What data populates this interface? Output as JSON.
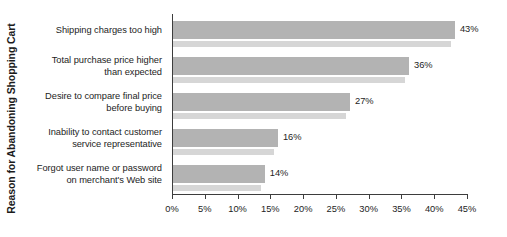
{
  "chart_data": {
    "type": "bar",
    "orientation": "horizontal",
    "title": "",
    "xlabel": "",
    "ylabel": "Reason for Abandoning Shopping Cart",
    "categories": [
      "Shipping charges too high",
      "Total purchase price higher\nthan expected",
      "Desire to compare final price\nbefore buying",
      "Inability to contact customer\nservice representative",
      "Forgot user name or password\non merchant's Web site"
    ],
    "values": [
      43,
      36,
      27,
      16,
      14
    ],
    "value_labels": [
      "43%",
      "36%",
      "27%",
      "16%",
      "14%"
    ],
    "xlim": [
      0,
      45
    ],
    "xticks": [
      0,
      5,
      10,
      15,
      20,
      25,
      30,
      35,
      40,
      45
    ],
    "xtick_labels": [
      "0%",
      "5%",
      "10%",
      "15%",
      "20%",
      "25%",
      "30%",
      "35%",
      "40%",
      "45%"
    ],
    "grid": false,
    "legend": false,
    "bar_color": "#b3b3b3",
    "bar_shadow_color": "#d6d6d6",
    "axis_color": "#3d3d3d",
    "text_color": "#1d1d1d",
    "background": "#ffffff"
  }
}
